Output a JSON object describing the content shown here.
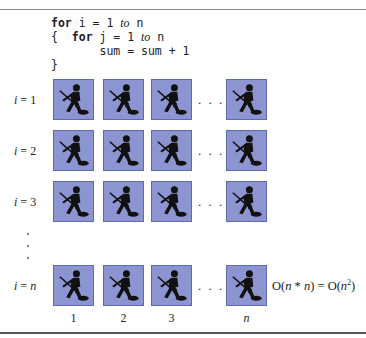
{
  "code": {
    "line1": {
      "kw": "for",
      "pre": " i = 1 ",
      "to": "to",
      "post": " n"
    },
    "line2": {
      "brace": "{  ",
      "kw": "for",
      "pre": " j = 1 ",
      "to": "to",
      "post": " n"
    },
    "line3": "       sum = sum + 1",
    "line4": "}"
  },
  "rows": [
    {
      "var": "i",
      "eq": " = ",
      "val": "1"
    },
    {
      "var": "i",
      "eq": " = ",
      "val": "2"
    },
    {
      "var": "i",
      "eq": " = ",
      "val": "3"
    },
    {
      "var": "i",
      "eq": " = ",
      "val": "n"
    }
  ],
  "ellipsis": ". . .",
  "columns": [
    "1",
    "2",
    "3",
    "n"
  ],
  "complexity": {
    "prefix": "O(",
    "n1": "n",
    "mid": " * ",
    "n2": "n",
    "eq": ") = O(",
    "n3": "n",
    "exp": "2",
    "close": ")"
  },
  "colors": {
    "tile": "#8c95d2",
    "tile_border": "#5f69ad",
    "figure": "#111111"
  }
}
